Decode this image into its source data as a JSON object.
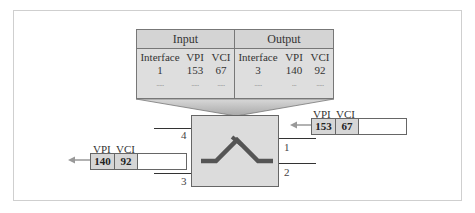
{
  "table": {
    "input_header": "Input",
    "output_header": "Output",
    "columns": {
      "input": [
        "Interface",
        "VPI",
        "VCI"
      ],
      "output": [
        "Interface",
        "VPI",
        "VCI"
      ]
    },
    "rows": [
      {
        "in_interface": "1",
        "in_vpi": "153",
        "in_vci": "67",
        "out_interface": "3",
        "out_vpi": "140",
        "out_vci": "92"
      },
      {
        "in_interface": ".....",
        "in_vpi": ".....",
        "in_vci": ".....",
        "out_interface": ".....",
        "out_vpi": "...",
        "out_vci": "....."
      }
    ]
  },
  "ports": {
    "p1": "1",
    "p2": "2",
    "p3": "3",
    "p4": "4"
  },
  "incoming_cell": {
    "vpi_label": "VPI",
    "vci_label": "VCI",
    "vpi": "153",
    "vci": "67"
  },
  "outgoing_cell": {
    "vpi_label": "VPI",
    "vci_label": "VCI",
    "vpi": "140",
    "vci": "92"
  },
  "colors": {
    "fill": "#dcdcdc",
    "switch_path": "#555555",
    "arrow": "#999999",
    "border": "#666666"
  }
}
